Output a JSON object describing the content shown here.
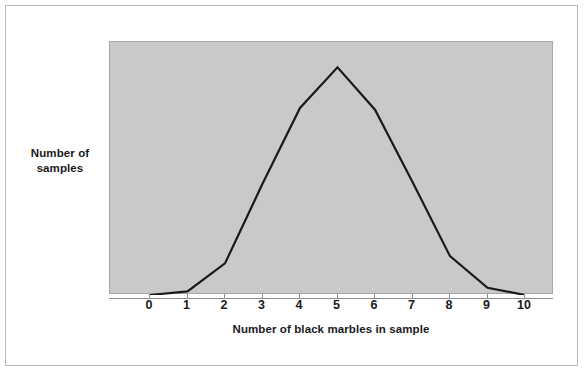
{
  "figure": {
    "background_color": "#ffffff",
    "border_color": "#b9b9b9",
    "panel_color": "#c9c9c9",
    "line_color": "#1a1a1a"
  },
  "chart_data": {
    "type": "line",
    "title": "",
    "subtitle": "",
    "xlabel": "Number of black marbles in sample",
    "ylabel": "Number of samples",
    "x": [
      0,
      1,
      2,
      3,
      4,
      5,
      6,
      7,
      8,
      9,
      10
    ],
    "categories": [
      "0",
      "1",
      "2",
      "3",
      "4",
      "5",
      "6",
      "7",
      "8",
      "9",
      "10"
    ],
    "values": [
      0,
      4,
      35,
      123,
      207,
      252,
      205,
      125,
      43,
      8,
      0
    ],
    "series": [
      {
        "name": "Number of samples",
        "values": [
          0,
          4,
          35,
          123,
          207,
          252,
          205,
          125,
          43,
          8,
          0
        ]
      }
    ],
    "xlim": [
      0,
      10
    ],
    "ylim": [
      0,
      270
    ],
    "xticks": [
      "0",
      "1",
      "2",
      "3",
      "4",
      "5",
      "6",
      "7",
      "8",
      "9",
      "10"
    ],
    "yticks": [],
    "grid": false,
    "legend": false,
    "legend_position": "none",
    "annotations": []
  }
}
